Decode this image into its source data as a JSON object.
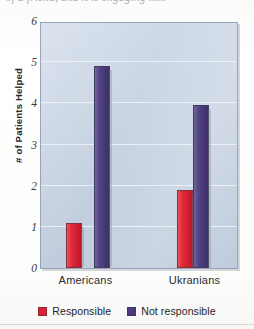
{
  "figure": {
    "cropped_caption_top": "of a friend, and it is engaging in...",
    "background_color": "#fdfdfb"
  },
  "chart_data": {
    "type": "bar",
    "title": "",
    "subtitle": "",
    "xlabel": "",
    "ylabel": "# of Patients Helped",
    "categories": [
      "Americans",
      "Ukranians"
    ],
    "series": [
      {
        "name": "Responsible",
        "color": "#e0202f",
        "values": [
          1.1,
          1.9
        ]
      },
      {
        "name": "Not responsible",
        "color": "#4a3a7e",
        "values": [
          4.9,
          3.95
        ]
      }
    ],
    "ylim": [
      0,
      6
    ],
    "yticks": [
      0,
      1,
      2,
      3,
      4,
      5,
      6
    ],
    "ytick_labels": [
      "0",
      "1",
      "2",
      "3",
      "4",
      "5",
      "6"
    ],
    "grid": true,
    "grid_color": "#eef2f8",
    "legend_position": "bottom",
    "plot_background": "#c6d3e4",
    "plot_border_color": "#9aa4b4"
  }
}
